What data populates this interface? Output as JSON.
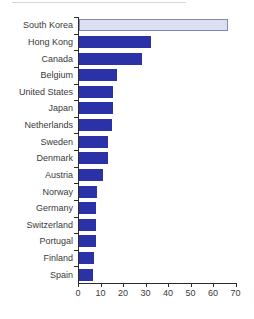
{
  "figure": {
    "background": "#ffffff",
    "title": ""
  },
  "chart_data": {
    "type": "bar",
    "orientation": "horizontal",
    "title": "",
    "xlabel": "",
    "ylabel": "",
    "categories": [
      "South Korea",
      "Hong Kong",
      "Canada",
      "Belgium",
      "United States",
      "Japan",
      "Netherlands",
      "Sweden",
      "Denmark",
      "Austria",
      "Norway",
      "Germany",
      "Switzerland",
      "Portugal",
      "Finland",
      "Spain"
    ],
    "values": [
      66,
      32,
      28,
      17,
      15,
      15,
      14.5,
      13,
      13,
      10.5,
      8,
      7.5,
      7.5,
      7.5,
      6.5,
      6
    ],
    "x_ticks": [
      0,
      10,
      20,
      30,
      40,
      50,
      60,
      70
    ],
    "xlim": [
      0,
      70
    ],
    "grid": false,
    "legend": false,
    "highlight_category": "South Korea",
    "colors": {
      "bar_fill": "#2b31a6",
      "highlight_fill": "#dcdff1",
      "highlight_border": "#7e87c3",
      "axis": "#2b2b2b",
      "label": "#3a3a3a"
    }
  }
}
